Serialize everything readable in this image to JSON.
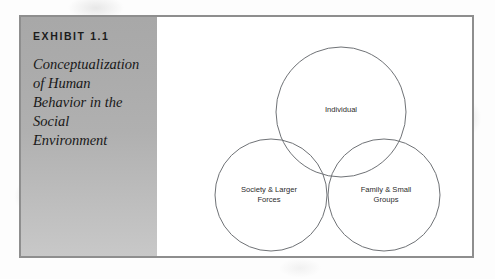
{
  "exhibit": {
    "number": "EXHIBIT 1.1",
    "title_lines": [
      "Conceptualization",
      "of Human",
      "Behavior in the",
      "Social",
      "Environment"
    ]
  },
  "colors": {
    "panel_gray_top": "#a8a8a8",
    "panel_gray_bottom": "#c8c8c8",
    "frame_border": "#8e8e8e",
    "circle_stroke": "#6f7276",
    "label_text": "#2b2b2b",
    "page_background": "#fdfdfd"
  },
  "chart_data": {
    "type": "diagram",
    "diagram_type": "venn",
    "title": "Conceptualization of Human Behavior in the Social Environment",
    "sets": [
      {
        "id": "individual",
        "label": "Individual",
        "label_lines": [
          "Individual"
        ],
        "cx": 320,
        "cy": 95,
        "r": 65,
        "label_x": 320,
        "label_y": 92
      },
      {
        "id": "society-larger-forces",
        "label": "Society & Larger Forces",
        "label_lines": [
          "Society & Larger",
          "Forces"
        ],
        "cx": 250,
        "cy": 178,
        "r": 56,
        "label_x": 248,
        "label_y": 177
      },
      {
        "id": "family-small-groups",
        "label": "Family & Small Groups",
        "label_lines": [
          "Family & Small",
          "Groups"
        ],
        "cx": 363,
        "cy": 178,
        "r": 56,
        "label_x": 365,
        "label_y": 177
      }
    ],
    "overlaps": [
      "individual & society-larger-forces",
      "individual & family-small-groups",
      "society-larger-forces & family-small-groups",
      "all three"
    ]
  }
}
